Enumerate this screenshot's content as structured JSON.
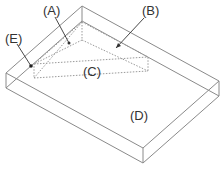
{
  "figure": {
    "type": "isometric-box-diagram",
    "labels": {
      "A": "(A)",
      "B": "(B)",
      "C": "(C)",
      "D": "(D)",
      "E": "(E)"
    },
    "colors": {
      "line": "#8a8a8a",
      "dashed": "#9a9a9a",
      "text": "#333333",
      "background": "#ffffff"
    }
  }
}
